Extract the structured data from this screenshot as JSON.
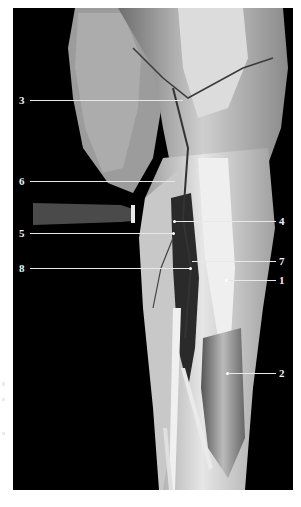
{
  "figure": {
    "background": "#000000",
    "labels": [
      {
        "id": "3",
        "text": "3",
        "side": "left",
        "y": 100
      },
      {
        "id": "6",
        "text": "6",
        "side": "left",
        "y": 181
      },
      {
        "id": "5",
        "text": "5",
        "side": "left",
        "y": 233
      },
      {
        "id": "8",
        "text": "8",
        "side": "left",
        "y": 268
      },
      {
        "id": "4",
        "text": "4",
        "side": "right",
        "y": 221
      },
      {
        "id": "7",
        "text": "7",
        "side": "right",
        "y": 261
      },
      {
        "id": "1",
        "text": "1",
        "side": "right",
        "y": 280
      },
      {
        "id": "2",
        "text": "2",
        "side": "right",
        "y": 373
      }
    ]
  }
}
